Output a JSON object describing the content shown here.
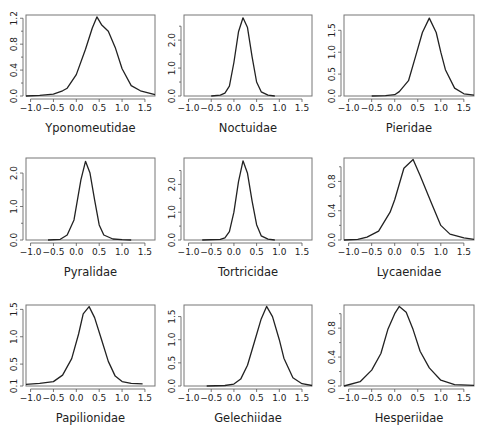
{
  "chart_data": [
    {
      "type": "line",
      "title": "Yponomeutidae",
      "xlim": [
        -1.1,
        1.72
      ],
      "xticks": [
        -1.0,
        -0.5,
        0.0,
        0.5,
        1.0,
        1.5
      ],
      "xtick_labels": [
        "-1.0",
        "-0.5",
        "0.0",
        "0.5",
        "1.0",
        "1.5"
      ],
      "ylim": [
        0,
        1.25
      ],
      "yticks": [
        0.0,
        0.4,
        0.8,
        1.2
      ],
      "ytick_labels": [
        "0.0",
        "0.4",
        "0.8",
        "1.2"
      ],
      "yminor": [
        0.2,
        0.6,
        1.0
      ],
      "x": [
        -1.1,
        -0.8,
        -0.5,
        -0.3,
        -0.2,
        0.0,
        0.2,
        0.35,
        0.45,
        0.55,
        0.7,
        0.85,
        1.0,
        1.2,
        1.4,
        1.72
      ],
      "y": [
        0.0,
        0.01,
        0.03,
        0.08,
        0.12,
        0.33,
        0.72,
        1.05,
        1.22,
        1.1,
        1.0,
        0.75,
        0.42,
        0.16,
        0.08,
        0.02
      ]
    },
    {
      "type": "line",
      "title": "Noctuidae",
      "xlim": [
        -1.1,
        1.72
      ],
      "xticks": [
        -1.0,
        -0.5,
        0.0,
        0.5,
        1.0,
        1.5
      ],
      "xtick_labels": [
        "-1.0",
        "-0.5",
        "0.0",
        "0.5",
        "1.0",
        "1.5"
      ],
      "ylim": [
        0,
        2.9
      ],
      "yticks": [
        0.0,
        1.0,
        2.0
      ],
      "ytick_labels": [
        "0.0",
        "1.0",
        "2.0"
      ],
      "yminor": [
        0.5,
        1.5,
        2.5
      ],
      "x": [
        -0.5,
        -0.3,
        -0.2,
        -0.1,
        0.0,
        0.1,
        0.2,
        0.3,
        0.4,
        0.5,
        0.6,
        0.75,
        0.9
      ],
      "y": [
        0.0,
        0.03,
        0.1,
        0.35,
        1.2,
        2.3,
        2.8,
        2.45,
        1.4,
        0.5,
        0.15,
        0.03,
        0.0
      ]
    },
    {
      "type": "line",
      "title": "Pieridae",
      "xlim": [
        -1.1,
        1.72
      ],
      "xticks": [
        -1.0,
        -0.5,
        0.0,
        0.5,
        1.0,
        1.5
      ],
      "xtick_labels": [
        "-1.0",
        "-0.5",
        "0.0",
        "0.5",
        "1.0",
        "1.5"
      ],
      "ylim": [
        0,
        1.85
      ],
      "yticks": [
        0.0,
        0.5,
        1.0,
        1.5
      ],
      "ytick_labels": [
        "0.0",
        "0.5",
        "1.0",
        "1.5"
      ],
      "yminor": [],
      "x": [
        -0.5,
        -0.2,
        0.0,
        0.1,
        0.3,
        0.45,
        0.6,
        0.75,
        0.9,
        1.0,
        1.1,
        1.3,
        1.5,
        1.72
      ],
      "y": [
        0.0,
        0.01,
        0.03,
        0.1,
        0.35,
        0.9,
        1.45,
        1.78,
        1.45,
        1.0,
        0.6,
        0.18,
        0.05,
        0.02
      ]
    },
    {
      "type": "line",
      "title": "Pyralidae",
      "xlim": [
        -1.1,
        1.72
      ],
      "xticks": [
        -1.0,
        -0.5,
        0.0,
        0.5,
        1.0,
        1.5
      ],
      "xtick_labels": [
        "-1.0",
        "-0.5",
        "0.0",
        "0.5",
        "1.0",
        "1.5"
      ],
      "ylim": [
        0,
        2.45
      ],
      "yticks": [
        0.0,
        1.0,
        2.0
      ],
      "ytick_labels": [
        "0.0",
        "1.0",
        "2.0"
      ],
      "yminor": [
        0.5,
        1.5
      ],
      "x": [
        -0.62,
        -0.35,
        -0.2,
        -0.05,
        0.1,
        0.2,
        0.3,
        0.4,
        0.5,
        0.6,
        0.8,
        1.0,
        1.2
      ],
      "y": [
        0.0,
        0.02,
        0.15,
        0.6,
        1.8,
        2.35,
        2.0,
        1.2,
        0.45,
        0.15,
        0.03,
        0.01,
        0.0
      ]
    },
    {
      "type": "line",
      "title": "Tortricidae",
      "xlim": [
        -1.1,
        1.72
      ],
      "xticks": [
        -1.0,
        -0.5,
        0.0,
        0.5,
        1.0,
        1.5
      ],
      "xtick_labels": [
        "-1.0",
        "-0.5",
        "0.0",
        "0.5",
        "1.0",
        "1.5"
      ],
      "ylim": [
        0,
        2.95
      ],
      "yticks": [
        0.0,
        1.0,
        2.0
      ],
      "ytick_labels": [
        "0.0",
        "1.0",
        "2.0"
      ],
      "yminor": [
        0.5,
        1.5,
        2.5
      ],
      "x": [
        -0.7,
        -0.3,
        -0.2,
        -0.1,
        0.0,
        0.1,
        0.2,
        0.3,
        0.4,
        0.5,
        0.6,
        0.75,
        0.9
      ],
      "y": [
        0.0,
        0.02,
        0.08,
        0.3,
        1.0,
        2.1,
        2.85,
        2.4,
        1.4,
        0.55,
        0.15,
        0.03,
        0.0
      ]
    },
    {
      "type": "line",
      "title": "Lycaenidae",
      "xlim": [
        -1.1,
        1.72
      ],
      "xticks": [
        -1.0,
        -0.5,
        0.0,
        0.5,
        1.0,
        1.5
      ],
      "xtick_labels": [
        "-1.0",
        "-0.5",
        "0.0",
        "0.5",
        "1.0",
        "1.5"
      ],
      "ylim": [
        0,
        1.12
      ],
      "yticks": [
        0.0,
        0.4,
        0.8
      ],
      "ytick_labels": [
        "0.0",
        "0.4",
        "0.8"
      ],
      "yminor": [
        0.2,
        0.6,
        1.0
      ],
      "x": [
        -1.1,
        -0.8,
        -0.6,
        -0.35,
        -0.1,
        0.0,
        0.2,
        0.4,
        0.55,
        0.8,
        1.0,
        1.2,
        1.5,
        1.72
      ],
      "y": [
        0.0,
        0.01,
        0.04,
        0.12,
        0.38,
        0.55,
        0.98,
        1.1,
        0.88,
        0.5,
        0.2,
        0.08,
        0.03,
        0.01
      ]
    },
    {
      "type": "line",
      "title": "Papilionidae",
      "xlim": [
        -1.1,
        1.72
      ],
      "xticks": [
        -1.0,
        -0.5,
        0.0,
        0.5,
        1.0,
        1.5
      ],
      "xtick_labels": [
        "-1.0",
        "-0.5",
        "0.0",
        "0.5",
        "1.0",
        "1.5"
      ],
      "ylim": [
        0.1,
        1.58
      ],
      "yticks": [
        0.1,
        0.5,
        1.0,
        1.5
      ],
      "ytick_labels": [
        "0.1",
        "0.5",
        "1.0",
        "1.5"
      ],
      "yminor": [],
      "x": [
        -1.1,
        -0.8,
        -0.5,
        -0.3,
        -0.1,
        0.05,
        0.15,
        0.28,
        0.4,
        0.55,
        0.7,
        0.85,
        1.0,
        1.2,
        1.45
      ],
      "y": [
        0.13,
        0.15,
        0.18,
        0.3,
        0.6,
        1.05,
        1.42,
        1.55,
        1.35,
        0.95,
        0.55,
        0.28,
        0.18,
        0.15,
        0.14
      ]
    },
    {
      "type": "line",
      "title": "Gelechiidae",
      "xlim": [
        -1.1,
        1.72
      ],
      "xticks": [
        -1.0,
        -0.5,
        0.0,
        0.5,
        1.0,
        1.5
      ],
      "xtick_labels": [
        "-1.0",
        "-0.5",
        "0.0",
        "0.5",
        "1.0",
        "1.5"
      ],
      "ylim": [
        0,
        1.75
      ],
      "yticks": [
        0.0,
        0.5,
        1.0,
        1.5
      ],
      "ytick_labels": [
        "0.0",
        "0.5",
        "1.0",
        "1.5"
      ],
      "yminor": [],
      "x": [
        -0.6,
        -0.2,
        0.0,
        0.15,
        0.3,
        0.45,
        0.6,
        0.72,
        0.85,
        1.0,
        1.1,
        1.3,
        1.5,
        1.72
      ],
      "y": [
        0.0,
        0.01,
        0.04,
        0.15,
        0.45,
        0.95,
        1.45,
        1.72,
        1.5,
        1.0,
        0.6,
        0.18,
        0.05,
        0.01
      ]
    },
    {
      "type": "line",
      "title": "Hesperiidae",
      "xlim": [
        -1.1,
        1.72
      ],
      "xticks": [
        -1.0,
        -0.5,
        0.0,
        0.5,
        1.0,
        1.5
      ],
      "xtick_labels": [
        "-1.0",
        "-0.5",
        "0.0",
        "0.5",
        "1.0",
        "1.5"
      ],
      "ylim": [
        0,
        1.12
      ],
      "yticks": [
        0.0,
        0.4,
        0.8
      ],
      "ytick_labels": [
        "0.0",
        "0.4",
        "0.8"
      ],
      "yminor": [
        0.2,
        0.6,
        1.0
      ],
      "x": [
        -1.1,
        -0.75,
        -0.5,
        -0.3,
        -0.15,
        0.0,
        0.1,
        0.25,
        0.4,
        0.55,
        0.75,
        1.0,
        1.3,
        1.72
      ],
      "y": [
        0.0,
        0.06,
        0.22,
        0.45,
        0.78,
        1.0,
        1.1,
        1.02,
        0.78,
        0.48,
        0.25,
        0.08,
        0.02,
        0.01
      ]
    }
  ],
  "layout": {
    "panel_frames": [
      {
        "left": 26,
        "top": 15,
        "width": 129,
        "height": 81
      },
      {
        "left": 184,
        "top": 15,
        "width": 128,
        "height": 81
      },
      {
        "left": 344,
        "top": 15,
        "width": 130,
        "height": 81
      },
      {
        "left": 26,
        "top": 158,
        "width": 129,
        "height": 82
      },
      {
        "left": 184,
        "top": 158,
        "width": 128,
        "height": 82
      },
      {
        "left": 344,
        "top": 158,
        "width": 130,
        "height": 82
      },
      {
        "left": 26,
        "top": 305,
        "width": 129,
        "height": 81
      },
      {
        "left": 184,
        "top": 305,
        "width": 128,
        "height": 81
      },
      {
        "left": 344,
        "top": 305,
        "width": 130,
        "height": 81
      }
    ]
  }
}
